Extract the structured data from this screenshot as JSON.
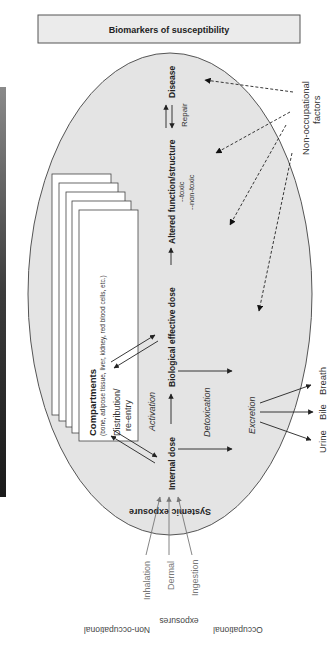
{
  "header": {
    "title": "Biomarkers of susceptibility"
  },
  "main_flow": {
    "internal_dose": "Internal dose",
    "biological_effective_dose": "Biological effective dose",
    "altered_function": "Altered function/structure",
    "toxic": "--toxic",
    "non_toxic": "--non-toxic",
    "disease": "Disease",
    "repair": "Repair",
    "activation": "Activation",
    "detoxication": "Detoxication",
    "excretion": "Excretion"
  },
  "compartments": {
    "title": "Compartments",
    "subtitle": "(bone, adipose tissue, liver, kidney, red blood cells, etc.)",
    "distribution_line1": "Distribution/",
    "distribution_line2": "re-entry",
    "card_count": 5
  },
  "excretion_routes": [
    "Urine",
    "Bile",
    "Breath"
  ],
  "non_occupational_factors": {
    "line1": "Non-occupational",
    "line2": "factors",
    "arrow_count": 4
  },
  "systemic_exposure": "Systemic exposure",
  "exposure_routes": [
    "Inhalation",
    "Dermal",
    "Ingestion"
  ],
  "exposure_sources": {
    "left": "Non-occupational",
    "middle": "exposures",
    "right": "Occupational"
  },
  "colors": {
    "ellipse_fill": "#e4e4e4",
    "header_fill": "#ebebeb",
    "stroke": "#444444",
    "text": "#222222",
    "route_gray": "#777777"
  }
}
